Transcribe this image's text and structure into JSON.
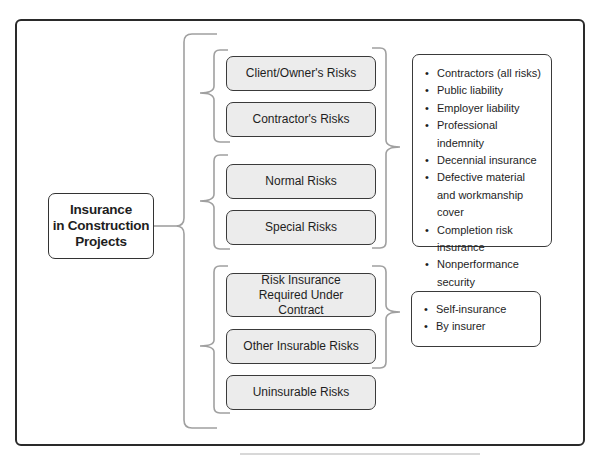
{
  "diagram": {
    "root": {
      "lines": [
        "Insurance",
        "in Construction",
        "Projects"
      ]
    },
    "groups": [
      {
        "name": "party-based",
        "items": [
          "Client/Owner's Risks",
          "Contractor's Risks"
        ]
      },
      {
        "name": "risk-type",
        "items": [
          "Normal Risks",
          "Special Risks"
        ]
      },
      {
        "name": "insurability",
        "items": [
          "Risk Insurance Required Under Contract",
          "Other Insurable Risks",
          "Uninsurable Risks"
        ]
      }
    ],
    "insurance_types": [
      "Contractors (all risks)",
      "Public liability",
      "Employer liability",
      "Professional indemnity",
      "Decennial insurance",
      "Defective material and workmanship cover",
      "Completion risk insurance",
      "Nonperformance security",
      "Surety bonds"
    ],
    "insurance_providers": [
      "Self-insurance",
      "By insurer"
    ]
  },
  "colors": {
    "frame": "#2a2a2a",
    "box_fill": "#ececec",
    "bracket": "#9a9a9a"
  }
}
